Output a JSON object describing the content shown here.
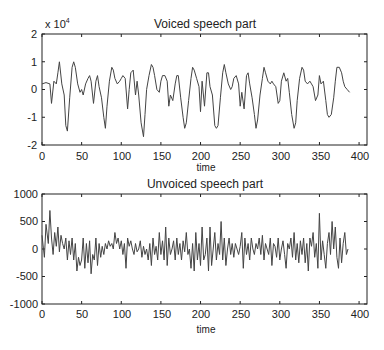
{
  "chart_data": [
    {
      "type": "line",
      "title": "Voiced speech part",
      "xlabel": "time",
      "ylabel": "",
      "y_multiplier_label": "x 10^4",
      "xlim": [
        0,
        410
      ],
      "ylim": [
        -2,
        2
      ],
      "xticks": [
        0,
        50,
        100,
        150,
        200,
        250,
        300,
        350,
        400
      ],
      "yticks": [
        -2,
        -1,
        0,
        1,
        2
      ],
      "grid": false,
      "series": [
        {
          "name": "voiced",
          "color": "#444444",
          "x": [
            0,
            5,
            10,
            12,
            15,
            18,
            20,
            22,
            25,
            28,
            30,
            32,
            35,
            38,
            40,
            42,
            45,
            48,
            50,
            52,
            55,
            58,
            60,
            62,
            65,
            68,
            70,
            72,
            75,
            78,
            80,
            82,
            85,
            88,
            90,
            92,
            95,
            98,
            100,
            102,
            105,
            108,
            110,
            112,
            115,
            118,
            120,
            122,
            125,
            128,
            130,
            132,
            135,
            138,
            140,
            142,
            145,
            148,
            150,
            152,
            155,
            158,
            160,
            162,
            165,
            168,
            170,
            172,
            175,
            178,
            180,
            182,
            185,
            188,
            190,
            192,
            195,
            198,
            200,
            202,
            205,
            208,
            210,
            212,
            215,
            218,
            220,
            222,
            225,
            228,
            230,
            232,
            235,
            238,
            240,
            242,
            245,
            248,
            250,
            252,
            255,
            258,
            260,
            262,
            265,
            268,
            270,
            272,
            275,
            278,
            280,
            282,
            285,
            288,
            290,
            292,
            295,
            298,
            300,
            302,
            305,
            308,
            310,
            312,
            315,
            318,
            320,
            322,
            325,
            328,
            330,
            332,
            335,
            338,
            340,
            342,
            345,
            348,
            350,
            352,
            355,
            358,
            360,
            362,
            365,
            368,
            370,
            372,
            375,
            378,
            380,
            382,
            385,
            388,
            390,
            392,
            395,
            398,
            400,
            405,
            410
          ],
          "y": [
            0.2,
            0.25,
            0.2,
            -0.5,
            0.3,
            0.2,
            0.6,
            1.0,
            0.2,
            -0.2,
            -1.3,
            -1.5,
            -0.3,
            0.8,
            1.0,
            0.8,
            0.2,
            -0.1,
            0.0,
            -0.2,
            0.2,
            0.4,
            0.5,
            0.3,
            -0.5,
            0.3,
            0.5,
            0.1,
            -0.3,
            -1.0,
            -1.4,
            -0.6,
            0.3,
            0.8,
            0.7,
            0.4,
            0.2,
            0.3,
            0.4,
            0.5,
            0.4,
            -0.7,
            0.0,
            0.6,
            0.7,
            -0.2,
            0.3,
            -0.2,
            -1.2,
            -1.7,
            -0.9,
            0.0,
            0.5,
            0.9,
            0.8,
            0.5,
            0.0,
            -0.1,
            0.3,
            0.5,
            0.5,
            0.3,
            -0.6,
            -0.2,
            -0.4,
            0.2,
            0.5,
            0.5,
            -0.3,
            -1.0,
            -1.4,
            -1.2,
            -0.4,
            0.4,
            0.8,
            0.7,
            0.4,
            0.1,
            -0.8,
            0.3,
            -0.6,
            0.6,
            0.6,
            0.1,
            -0.2,
            -1.3,
            -1.4,
            -1.3,
            -0.3,
            0.6,
            0.9,
            0.6,
            0.2,
            0.0,
            0.1,
            0.4,
            0.5,
            0.2,
            -0.6,
            -0.1,
            -0.7,
            0.5,
            0.6,
            0.2,
            -0.3,
            -0.9,
            -1.4,
            -1.1,
            -0.2,
            0.4,
            0.8,
            0.6,
            0.3,
            0.2,
            0.3,
            0.2,
            0.1,
            -0.5,
            -0.4,
            0.3,
            0.6,
            0.3,
            0.4,
            -0.1,
            -0.9,
            -1.4,
            -1.2,
            -0.4,
            0.4,
            0.8,
            0.7,
            0.3,
            0.2,
            0.3,
            0.2,
            0.1,
            -0.4,
            -0.2,
            0.5,
            0.2,
            0.3,
            -0.4,
            -0.9,
            -1.0,
            -0.9,
            -0.3,
            0.3,
            0.8,
            0.8,
            0.6,
            0.3,
            0.1,
            0.0,
            -0.1
          ]
        }
      ]
    },
    {
      "type": "line",
      "title": "Unvoiced speech part",
      "xlabel": "time",
      "ylabel": "",
      "xlim": [
        0,
        410
      ],
      "ylim": [
        -1000,
        1000
      ],
      "xticks": [
        0,
        50,
        100,
        150,
        200,
        250,
        300,
        350,
        400
      ],
      "yticks": [
        -1000,
        -500,
        0,
        500,
        1000
      ],
      "grid": false,
      "series": [
        {
          "name": "unvoiced",
          "color": "#444444",
          "x": [
            0,
            3,
            5,
            8,
            10,
            12,
            14,
            16,
            18,
            20,
            22,
            24,
            26,
            28,
            30,
            32,
            34,
            36,
            38,
            40,
            42,
            44,
            46,
            48,
            50,
            52,
            54,
            56,
            58,
            60,
            62,
            64,
            66,
            68,
            70,
            72,
            74,
            76,
            78,
            80,
            82,
            84,
            86,
            88,
            90,
            92,
            94,
            96,
            98,
            100,
            102,
            104,
            106,
            108,
            110,
            112,
            114,
            116,
            118,
            120,
            122,
            124,
            126,
            128,
            130,
            132,
            134,
            136,
            138,
            140,
            142,
            144,
            146,
            148,
            150,
            152,
            154,
            156,
            158,
            160,
            162,
            164,
            166,
            168,
            170,
            172,
            174,
            176,
            178,
            180,
            182,
            184,
            186,
            188,
            190,
            192,
            194,
            196,
            198,
            200,
            202,
            204,
            206,
            208,
            210,
            212,
            214,
            216,
            218,
            220,
            222,
            224,
            226,
            228,
            230,
            232,
            234,
            236,
            238,
            240,
            242,
            244,
            246,
            248,
            250,
            252,
            254,
            256,
            258,
            260,
            262,
            264,
            266,
            268,
            270,
            272,
            274,
            276,
            278,
            280,
            282,
            284,
            286,
            288,
            290,
            292,
            294,
            296,
            298,
            300,
            302,
            304,
            306,
            308,
            310,
            312,
            314,
            316,
            318,
            320,
            322,
            324,
            326,
            328,
            330,
            332,
            334,
            336,
            338,
            340,
            342,
            344,
            346,
            348,
            350,
            352,
            354,
            356,
            358,
            360,
            362,
            364,
            366,
            368,
            370,
            372,
            374,
            376,
            378,
            380,
            382,
            384,
            386,
            388,
            390,
            392,
            394,
            396,
            398,
            400,
            402,
            404,
            406,
            408,
            410
          ],
          "y": [
            250,
            -150,
            450,
            100,
            700,
            200,
            -100,
            300,
            50,
            400,
            -50,
            250,
            100,
            0,
            200,
            -200,
            150,
            -100,
            200,
            -200,
            100,
            -400,
            -150,
            -300,
            -200,
            200,
            -350,
            100,
            -250,
            150,
            -450,
            -100,
            -200,
            200,
            -300,
            100,
            -150,
            50,
            -100,
            100,
            0,
            150,
            50,
            100,
            0,
            300,
            100,
            200,
            0,
            150,
            -100,
            100,
            -350,
            200,
            50,
            150,
            0,
            -100,
            100,
            -50,
            0,
            150,
            -150,
            50,
            -100,
            0,
            -200,
            100,
            -300,
            200,
            -100,
            50,
            -200,
            300,
            -100,
            150,
            -200,
            400,
            -300,
            200,
            -100,
            0,
            150,
            -200,
            200,
            -100,
            100,
            -200,
            150,
            -50,
            300,
            -100,
            0,
            -350,
            100,
            -400,
            300,
            -200,
            100,
            -300,
            400,
            -200,
            -100,
            200,
            -400,
            400,
            -300,
            0,
            300,
            -200,
            100,
            -100,
            500,
            -200,
            200,
            -300,
            0,
            200,
            -100,
            100,
            -150,
            100,
            0,
            -100,
            50,
            300,
            -350,
            200,
            -100,
            100,
            -200,
            200,
            0,
            -100,
            100,
            0,
            200,
            -100,
            250,
            -200,
            100,
            0,
            -100,
            200,
            -300,
            100,
            50,
            -150,
            200,
            -200,
            0,
            150,
            -100,
            -350,
            100,
            0,
            200,
            -150,
            300,
            -200,
            100,
            -250,
            150,
            -100,
            200,
            -250,
            100,
            -400,
            200,
            50,
            300,
            -150,
            100,
            -350,
            650,
            -200,
            150,
            -100,
            -350,
            100,
            300,
            -100,
            500,
            0,
            400,
            -150,
            -350,
            200,
            -250,
            100,
            300,
            -100,
            0
          ]
        }
      ]
    }
  ],
  "plots": {
    "top": {
      "title": "Voiced speech part",
      "xlabel": "time",
      "multiplier_base": "x 10",
      "multiplier_exp": "4",
      "xtick_labels": [
        "0",
        "50",
        "100",
        "150",
        "200",
        "250",
        "300",
        "350",
        "400"
      ],
      "ytick_labels": [
        "2",
        "1",
        "0",
        "-1",
        "-2"
      ]
    },
    "bottom": {
      "title": "Unvoiced speech part",
      "xlabel": "time",
      "xtick_labels": [
        "0",
        "50",
        "100",
        "150",
        "200",
        "250",
        "300",
        "350",
        "400"
      ],
      "ytick_labels": [
        "1000",
        "500",
        "0",
        "-500",
        "-1000"
      ]
    }
  },
  "colors": {
    "line": "#444444",
    "axis": "#222222",
    "background": "#ffffff"
  }
}
